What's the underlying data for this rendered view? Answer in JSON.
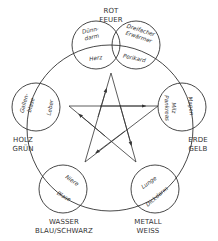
{
  "elements": {
    "fire": {
      "line1": "ROT",
      "line2": "FEUER",
      "yang_a": "Dünn-",
      "yang_b": "darm",
      "yin": "Herz",
      "yang2_a": "Dreifacher",
      "yang2_b": "Erwärmer",
      "yin2": "Perikard"
    },
    "earth": {
      "line1": "ERDE",
      "line2": "GELB",
      "yang": "Magen",
      "yin_a": "Milz",
      "yin_b": "Pankreas"
    },
    "metal": {
      "line1": "METALL",
      "line2": "WEISS",
      "yang": "Dickdarm",
      "yin": "Lunge"
    },
    "water": {
      "line1": "WASSER",
      "line2": "BLAU/SCHWARZ",
      "yang": "Blase",
      "yin": "Niere"
    },
    "wood": {
      "line1": "HOLZ",
      "line2": "GRÜN",
      "yang_a": "Gallen-",
      "yang_b": "blase",
      "yin": "Leber"
    }
  },
  "colors": {
    "stroke": "#333333",
    "background": "#ffffff"
  }
}
